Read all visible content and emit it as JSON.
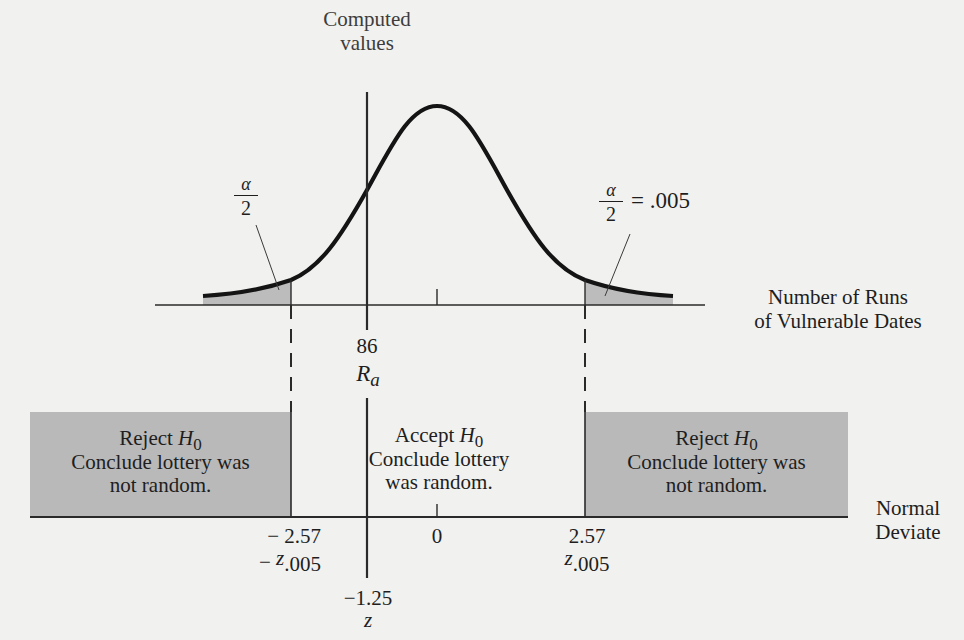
{
  "diagram": {
    "type": "two-tailed hypothesis test on normal distribution (runs test)",
    "colors": {
      "background": "#f1f1ef",
      "ink": "#1e1e1e",
      "shade": "#b9b9b9"
    },
    "top_label": {
      "line1": "Computed",
      "line2": "values"
    },
    "left_tail": {
      "alpha_num": "α",
      "alpha_den": "2"
    },
    "right_tail": {
      "alpha_num": "α",
      "alpha_den": "2",
      "equals_value": "= .005"
    },
    "upper_axis": {
      "title_line1": "Number of Runs",
      "title_line2": "of Vulnerable Dates",
      "computed_value": "86",
      "computed_symbol": "R",
      "computed_symbol_sub": "a"
    },
    "regions": [
      {
        "id": "reject-left",
        "title": "Reject ",
        "title_symbol": "H",
        "title_symbol_sub": "0",
        "line2": "Conclude lottery was",
        "line3": "not random.",
        "shaded": true
      },
      {
        "id": "accept",
        "title": "Accept ",
        "title_symbol": "H",
        "title_symbol_sub": "0",
        "line2": "Conclude lottery",
        "line3": "was random.",
        "shaded": false
      },
      {
        "id": "reject-right",
        "title": "Reject ",
        "title_symbol": "H",
        "title_symbol_sub": "0",
        "line2": "Conclude lottery was",
        "line3": "not random.",
        "shaded": true
      }
    ],
    "lower_axis": {
      "title_line1": "Normal",
      "title_line2": "Deviate",
      "ticks": [
        {
          "value": "− 2.57",
          "symbol_prefix": "− ",
          "symbol": "z",
          "symbol_sub": ".005"
        },
        {
          "value": "0"
        },
        {
          "value": "2.57",
          "symbol_prefix": "",
          "symbol": "z",
          "symbol_sub": ".005"
        }
      ],
      "computed_value": "−1.25",
      "computed_symbol": "z"
    }
  }
}
